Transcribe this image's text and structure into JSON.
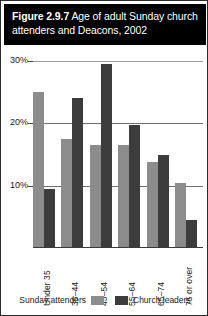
{
  "header": {
    "figure_number": "Figure 2.9.7",
    "title": " Age of adult Sunday church attenders and Deacons, 2002"
  },
  "chart_data": {
    "type": "bar",
    "title": "Age of adult Sunday church attenders and Deacons, 2002",
    "xlabel": "",
    "ylabel": "",
    "ylim": [
      0,
      30
    ],
    "yticks": [
      10,
      20,
      30
    ],
    "ytick_labels": [
      "10%",
      "20%",
      "30%"
    ],
    "grid": true,
    "legend_position": "bottom",
    "categories": [
      "Under 35",
      "35–44",
      "45–54",
      "55–64",
      "65–74",
      "75 or over"
    ],
    "series": [
      {
        "name": "Sunday attenders",
        "color": "#8c8c8c",
        "values": [
          25.0,
          17.5,
          16.5,
          16.5,
          13.8,
          10.5
        ]
      },
      {
        "name": "Church leaders",
        "color": "#3c3c3c",
        "values": [
          9.5,
          24.0,
          29.5,
          19.7,
          15.0,
          4.5
        ]
      }
    ]
  },
  "legend": {
    "items": [
      {
        "label": "Sunday attenders",
        "swatch": "light"
      },
      {
        "label": "Church leaders",
        "swatch": "dark"
      }
    ]
  }
}
